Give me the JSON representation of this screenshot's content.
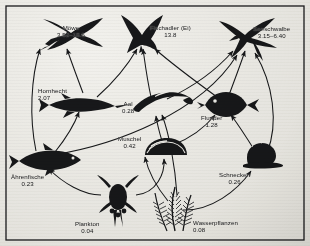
{
  "figure": {
    "type": "food-web-diagram",
    "background_color": "#f2f1ed",
    "ink_color": "#17181a",
    "border": "thin black rectangle frame"
  },
  "nodes": [
    {
      "id": "moewe",
      "label": "Möwe",
      "value": "3.52–18.5",
      "icon": "gull-silhouette",
      "x": 72,
      "y": 30,
      "label_x": 52,
      "label_y": 19
    },
    {
      "id": "fischadler",
      "label": "Fischadler (Ei)",
      "value": "13.8",
      "icon": "osprey-silhouette",
      "x": 140,
      "y": 30,
      "label_x": 148,
      "label_y": 19
    },
    {
      "id": "seeschwalbe",
      "label": "Seeschwalbe",
      "value": "3.15–6.40",
      "icon": "tern-silhouette",
      "x": 244,
      "y": 30,
      "label_x": 253,
      "label_y": 20
    },
    {
      "id": "hornhecht",
      "label": "Hornhecht",
      "value": "2.07",
      "icon": "garfish-silhouette",
      "x": 75,
      "y": 98,
      "label_x": 38,
      "label_y": 83
    },
    {
      "id": "aal",
      "label": "Aal",
      "value": "0.28",
      "icon": "eel-silhouette",
      "x": 150,
      "y": 100,
      "label_x": 122,
      "label_y": 96
    },
    {
      "id": "flunder",
      "label": "Flunder",
      "value": "1.28",
      "icon": "flounder-silhouette",
      "x": 219,
      "y": 100,
      "label_x": 200,
      "label_y": 110
    },
    {
      "id": "muschel",
      "label": "Muschel",
      "value": "0.42",
      "icon": "mussel-silhouette",
      "x": 155,
      "y": 145,
      "label_x": 118,
      "label_y": 131
    },
    {
      "id": "schnecken",
      "label": "Schnecken",
      "value": "0.26",
      "icon": "snail-silhouette",
      "x": 253,
      "y": 155,
      "label_x": 221,
      "label_y": 167
    },
    {
      "id": "aehrenfische",
      "label": "Ährenfische",
      "value": "0.23",
      "icon": "silverside-silhouette",
      "x": 40,
      "y": 155,
      "label_x": 11,
      "label_y": 169
    },
    {
      "id": "plankton",
      "label": "Plankton",
      "value": "0.04",
      "icon": "copepod-silhouette",
      "x": 113,
      "y": 196,
      "label_x": 76,
      "label_y": 216
    },
    {
      "id": "wasserpflanzen",
      "label": "Wasserpflanzen",
      "value": "0.08",
      "icon": "waterplant-silhouette",
      "x": 170,
      "y": 200,
      "label_x": 192,
      "label_y": 215
    }
  ],
  "links": [
    {
      "from": "plankton",
      "to": "aehrenfische"
    },
    {
      "from": "plankton",
      "to": "muschel"
    },
    {
      "from": "wasserpflanzen",
      "to": "muschel"
    },
    {
      "from": "wasserpflanzen",
      "to": "schnecken"
    },
    {
      "from": "wasserpflanzen",
      "to": "aal"
    },
    {
      "from": "aehrenfische",
      "to": "hornhecht"
    },
    {
      "from": "aehrenfische",
      "to": "moewe"
    },
    {
      "from": "aehrenfische",
      "to": "seeschwalbe"
    },
    {
      "from": "muschel",
      "to": "aal"
    },
    {
      "from": "muschel",
      "to": "flunder"
    },
    {
      "from": "schnecken",
      "to": "flunder"
    },
    {
      "from": "schnecken",
      "to": "seeschwalbe"
    },
    {
      "from": "hornhecht",
      "to": "moewe"
    },
    {
      "from": "hornhecht",
      "to": "fischadler"
    },
    {
      "from": "aal",
      "to": "fischadler"
    },
    {
      "from": "aal",
      "to": "seeschwalbe"
    },
    {
      "from": "flunder",
      "to": "seeschwalbe"
    },
    {
      "from": "flunder",
      "to": "fischadler"
    }
  ]
}
